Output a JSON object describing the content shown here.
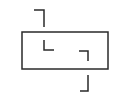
{
  "diagram": {
    "background": "#ffffff",
    "stroke_color": "#2a2a2a",
    "stroke_width": 1.5,
    "rectangle": {
      "x": 22,
      "y": 32,
      "width": 86,
      "height": 37
    },
    "brackets": [
      {
        "name": "top-left-outer-bracket",
        "points": "34,10 44,10 44,27"
      },
      {
        "name": "inner-left-corner",
        "points": "44,40 44,50 54,50"
      },
      {
        "name": "inner-right-corner",
        "points": "79,51 88,51 88,61"
      },
      {
        "name": "bottom-right-outer-bracket",
        "points": "88,75 88,91 80,91"
      }
    ]
  }
}
